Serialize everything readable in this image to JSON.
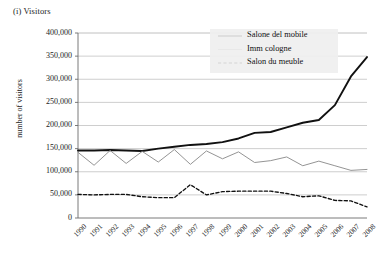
{
  "panel": {
    "title": "(i) Visitors"
  },
  "chart_data": {
    "type": "line",
    "title": "(i) Visitors",
    "xlabel": "",
    "ylabel": "number of visitors",
    "grid": true,
    "legend_position": "top-center",
    "ylim": [
      0,
      400000
    ],
    "ytick_labels": [
      "400,000",
      "350,000",
      "300,000",
      "250,000",
      "200,000",
      "150,000",
      "100,000",
      "50,000",
      "0"
    ],
    "ytick_values": [
      400000,
      350000,
      300000,
      250000,
      200000,
      150000,
      100000,
      50000,
      0
    ],
    "categories": [
      "1990",
      "1991",
      "1992",
      "1993",
      "1994",
      "1995",
      "1996",
      "1997",
      "1998",
      "1999",
      "2000",
      "2001",
      "2002",
      "2003",
      "2004",
      "2005",
      "2006",
      "2007",
      "2008"
    ],
    "series": [
      {
        "name": "Salone del mobile",
        "style": "solid-thick",
        "color": "#111111",
        "values": [
          146000,
          146000,
          147000,
          146000,
          145000,
          150000,
          154000,
          158000,
          160000,
          164000,
          172000,
          184000,
          186000,
          196000,
          206000,
          212000,
          244000,
          306000,
          348000
        ]
      },
      {
        "name": "Imm cologne",
        "style": "solid-thin",
        "color": "#8e8e8e",
        "values": [
          142000,
          114000,
          146000,
          118000,
          144000,
          121000,
          148000,
          116000,
          145000,
          128000,
          143000,
          120000,
          124000,
          132000,
          113000,
          123000,
          113000,
          103000,
          105000
        ]
      },
      {
        "name": "Salon du meuble",
        "style": "dashed",
        "color": "#111111",
        "values": [
          51000,
          50000,
          51000,
          51000,
          46000,
          44000,
          44000,
          72000,
          50000,
          57000,
          58000,
          58000,
          58000,
          53000,
          46000,
          48000,
          38000,
          37000,
          24000
        ]
      }
    ]
  },
  "legend": {
    "items": [
      {
        "label": "Salone del mobile",
        "icon": "solid-thick-line-swatch"
      },
      {
        "label": "Imm cologne",
        "icon": "solid-thin-line-swatch"
      },
      {
        "label": "Salon du meuble",
        "icon": "dashed-line-swatch"
      }
    ]
  }
}
